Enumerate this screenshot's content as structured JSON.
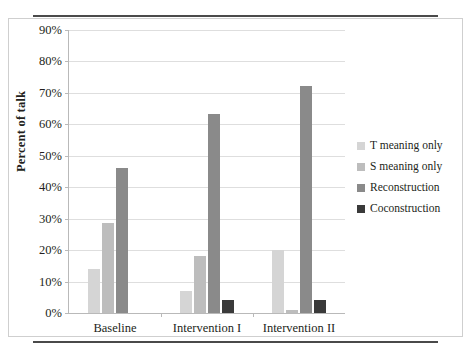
{
  "figure": {
    "y_axis_title": "Percent of talk"
  },
  "legend": {
    "entries": [
      {
        "label": "T meaning only",
        "color": "#d5d5d5"
      },
      {
        "label": "S meaning only",
        "color": "#bdbdbd"
      },
      {
        "label": "Reconstruction",
        "color": "#8a8a8a"
      },
      {
        "label": "Coconstruction",
        "color": "#3a3a3a"
      }
    ]
  },
  "axis": {
    "y_ticks": [
      "0%",
      "10%",
      "20%",
      "30%",
      "40%",
      "50%",
      "60%",
      "70%",
      "80%",
      "90%"
    ],
    "y_values": [
      0,
      10,
      20,
      30,
      40,
      50,
      60,
      70,
      80,
      90
    ]
  },
  "chart_data": {
    "type": "bar",
    "title": "",
    "xlabel": "",
    "ylabel": "Percent of talk",
    "categories": [
      "Baseline",
      "Intervention I",
      "Intervention II"
    ],
    "series": [
      {
        "name": "T meaning only",
        "color": "#d5d5d5",
        "values": [
          14,
          7,
          20
        ]
      },
      {
        "name": "S meaning only",
        "color": "#bdbdbd",
        "values": [
          28.5,
          18,
          1
        ]
      },
      {
        "name": "Reconstruction",
        "color": "#8a8a8a",
        "values": [
          46,
          63,
          72
        ]
      },
      {
        "name": "Coconstruction",
        "color": "#3a3a3a",
        "values": [
          0,
          4,
          4
        ]
      }
    ],
    "ylim": [
      0,
      90
    ],
    "ytick_format": "percent",
    "ytick_step": 10,
    "grid": true,
    "legend_position": "right"
  }
}
